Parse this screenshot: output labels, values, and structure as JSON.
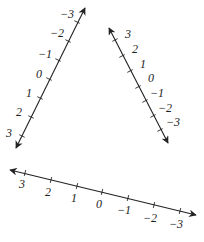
{
  "number_lines": [
    {
      "id": "left",
      "orientation": "diagonal rising to upper right",
      "start": [
        16,
        148
      ],
      "end": [
        85,
        8
      ],
      "ticks": [
        {
          "value": "3",
          "label": "3",
          "pos": [
            22,
            136
          ],
          "label_pos": [
            6,
            137
          ]
        },
        {
          "value": "2",
          "label": "2",
          "pos": [
            31,
            117
          ],
          "label_pos": [
            16,
            116
          ]
        },
        {
          "value": "1",
          "label": "1",
          "pos": [
            40,
            98
          ],
          "label_pos": [
            26,
            97
          ]
        },
        {
          "value": "0",
          "label": "0",
          "pos": [
            49,
            79
          ],
          "label_pos": [
            36,
            78
          ]
        },
        {
          "value": "-1",
          "label": "−1",
          "pos": [
            58,
            60
          ],
          "label_pos": [
            38,
            58
          ]
        },
        {
          "value": "-2",
          "label": "−2",
          "pos": [
            68,
            41
          ],
          "label_pos": [
            50,
            37
          ]
        },
        {
          "value": "-3",
          "label": "−3",
          "pos": [
            77,
            22
          ],
          "label_pos": [
            60,
            18
          ]
        }
      ]
    },
    {
      "id": "right",
      "orientation": "diagonal falling to lower right",
      "start": [
        109,
        28
      ],
      "end": [
        168,
        143
      ],
      "ticks": [
        {
          "value": "3",
          "label": "3",
          "pos": [
            115,
            40
          ],
          "label_pos": [
            125,
            38
          ]
        },
        {
          "value": "2",
          "label": "2",
          "pos": [
            122,
            56
          ],
          "label_pos": [
            132,
            53
          ]
        },
        {
          "value": "1",
          "label": "1",
          "pos": [
            130,
            71
          ],
          "label_pos": [
            140,
            68
          ]
        },
        {
          "value": "0",
          "label": "0",
          "pos": [
            138,
            87
          ],
          "label_pos": [
            148,
            82
          ]
        },
        {
          "value": "-1",
          "label": "−1",
          "pos": [
            145,
            101
          ],
          "label_pos": [
            150,
            97
          ]
        },
        {
          "value": "-2",
          "label": "−2",
          "pos": [
            153,
            116
          ],
          "label_pos": [
            158,
            112
          ]
        },
        {
          "value": "-3",
          "label": "−3",
          "pos": [
            160,
            130
          ],
          "label_pos": [
            166,
            126
          ]
        }
      ]
    },
    {
      "id": "bottom",
      "orientation": "nearly horizontal, descending to the right",
      "start": [
        10,
        170
      ],
      "end": [
        196,
        215
      ],
      "ticks": [
        {
          "value": "3",
          "label": "3",
          "pos": [
            25,
            173
          ],
          "label_pos": [
            19,
            188
          ]
        },
        {
          "value": "2",
          "label": "2",
          "pos": [
            51,
            180
          ],
          "label_pos": [
            45,
            196
          ]
        },
        {
          "value": "1",
          "label": "1",
          "pos": [
            77,
            186
          ],
          "label_pos": [
            71,
            202
          ]
        },
        {
          "value": "0",
          "label": "0",
          "pos": [
            102,
            192
          ],
          "label_pos": [
            96,
            208
          ]
        },
        {
          "value": "-1",
          "label": "−1",
          "pos": [
            128,
            198
          ],
          "label_pos": [
            117,
            214
          ]
        },
        {
          "value": "-2",
          "label": "−2",
          "pos": [
            154,
            205
          ],
          "label_pos": [
            143,
            222
          ]
        },
        {
          "value": "-3",
          "label": "−3",
          "pos": [
            180,
            211
          ],
          "label_pos": [
            169,
            228
          ]
        }
      ]
    }
  ],
  "colors": {
    "line": "#222222",
    "background": "#ffffff"
  }
}
